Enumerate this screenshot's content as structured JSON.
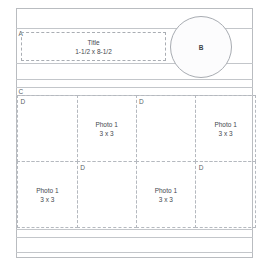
{
  "diagram": {
    "type": "page-layout-template",
    "zones": {
      "a": {
        "letter": "A",
        "title": "Title",
        "dimensions": "1-1/2 x 8-1/2"
      },
      "b": {
        "letter": "B",
        "shape": "circle"
      },
      "c": {
        "letter": "C"
      },
      "d": {
        "letter": "D"
      }
    },
    "photo_grid": {
      "rows": [
        {
          "cells": [
            {
              "label": "D",
              "title": "",
              "dimensions": "",
              "empty": true
            },
            {
              "label": "",
              "title": "Photo 1",
              "dimensions": "3 x 3",
              "empty": false
            },
            {
              "label": "D",
              "title": "",
              "dimensions": "",
              "empty": true
            },
            {
              "label": "",
              "title": "Photo 1",
              "dimensions": "3 x 3",
              "empty": false
            }
          ]
        },
        {
          "cells": [
            {
              "label": "",
              "title": "Photo 1",
              "dimensions": "3 x 3",
              "empty": false
            },
            {
              "label": "D",
              "title": "",
              "dimensions": "",
              "empty": true
            },
            {
              "label": "",
              "title": "Photo 1",
              "dimensions": "3 x 3",
              "empty": false
            },
            {
              "label": "D",
              "title": "",
              "dimensions": "",
              "empty": true
            }
          ]
        }
      ]
    },
    "colors": {
      "sheet_border": "#b9bcc0",
      "rule": "#c3c6ca",
      "dashed": "#b5b9bf",
      "text": "#44484e",
      "label_text": "#5b5f66"
    }
  }
}
